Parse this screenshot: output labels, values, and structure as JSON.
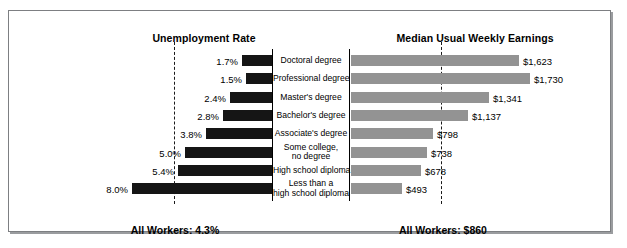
{
  "figure": {
    "left_title": "Unemployment Rate",
    "right_title": "Median Usual Weekly Earnings",
    "left_footer": "All Workers: 4.3%",
    "right_footer": "All Workers: $860"
  },
  "colors": {
    "left_bar": "#151515",
    "right_bar": "#939393",
    "frame": "#7d7f82",
    "text": "#000000"
  },
  "chart_data": {
    "type": "bar",
    "orientation": "horizontal-diverging",
    "categories": [
      "Doctoral degree",
      "Professional degree",
      "Master's degree",
      "Bachelor's degree",
      "Associate's degree",
      "Some college,\nno degree",
      "High school diploma",
      "Less than a\nhigh school diploma"
    ],
    "series": [
      {
        "name": "Unemployment Rate",
        "side": "left",
        "unit": "percent",
        "labels": [
          "1.7%",
          "1.5%",
          "2.4%",
          "2.8%",
          "3.8%",
          "5.0%",
          "5.4%",
          "8.0%"
        ],
        "values": [
          1.7,
          1.5,
          2.4,
          2.8,
          3.8,
          5.0,
          5.4,
          8.0
        ],
        "axis_max": 8.6,
        "reference_line": {
          "label": "All Workers: 4.3%",
          "value": 4.3
        }
      },
      {
        "name": "Median Usual Weekly Earnings",
        "side": "right",
        "unit": "dollars",
        "labels": [
          "$1,623",
          "$1,730",
          "$1,341",
          "$1,137",
          "$798",
          "$738",
          "$678",
          "$493"
        ],
        "values": [
          1623,
          1730,
          1341,
          1137,
          798,
          738,
          678,
          493
        ],
        "axis_max": 1870,
        "reference_line": {
          "label": "All Workers: $860",
          "value": 860
        }
      }
    ],
    "xlabel": "",
    "ylabel": "",
    "grid": false,
    "legend": "none"
  }
}
